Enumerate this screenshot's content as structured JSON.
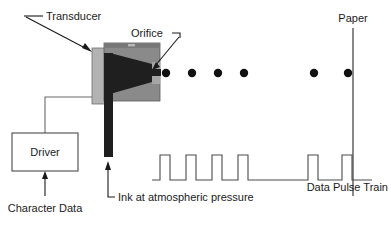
{
  "diagram": {
    "labels": {
      "transducer": "Transducer",
      "orifice": "Orifice",
      "paper": "Paper",
      "driver": "Driver",
      "character_data": "Character Data",
      "ink": "Ink at atmospheric pressure",
      "pulse_train": "Data Pulse Train"
    },
    "colors": {
      "line": "#1a1a1a",
      "text": "#1a1a1a",
      "transducer_plate": "#b3b3b3",
      "nozzle_body": "#8a8a8a",
      "nozzle_body_top": "#787878",
      "ink_chamber": "#1f1f1f",
      "ink_tube": "#1f1f1f",
      "droplet": "#111111",
      "paper_line": "#3a3a3a",
      "waveform": "#4a4a4a",
      "background": "#ffffff"
    },
    "droplets": {
      "count": 7,
      "radius": 4.2,
      "y": 73,
      "x_positions": [
        151,
        166,
        192,
        218,
        244,
        314,
        348
      ]
    },
    "pulse_train": {
      "baseline_y": 180,
      "top_y": 155,
      "start_x": 152,
      "end_x": 372,
      "pulse_width": 10,
      "pulse_start_x": [
        160,
        186,
        212,
        238,
        308,
        342
      ]
    },
    "paper": {
      "x": 353,
      "y_top": 28,
      "y_bottom": 196
    },
    "driver_box": {
      "x": 12,
      "y": 133,
      "width": 66,
      "height": 38
    }
  }
}
